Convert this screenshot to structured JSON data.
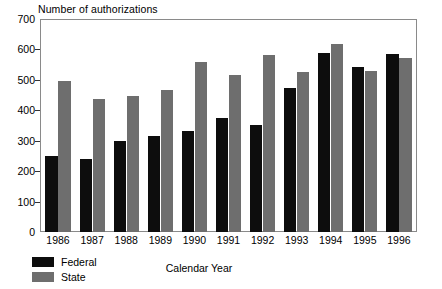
{
  "chart_data": {
    "type": "bar",
    "title": "Number of authorizations",
    "xlabel": "Calendar Year",
    "ylabel": "",
    "categories": [
      "1986",
      "1987",
      "1988",
      "1989",
      "1990",
      "1991",
      "1992",
      "1993",
      "1994",
      "1995",
      "1996"
    ],
    "series": [
      {
        "name": "Federal",
        "color": "#0d0d0d",
        "values": [
          250,
          240,
          300,
          318,
          335,
          378,
          352,
          475,
          590,
          545,
          588
        ]
      },
      {
        "name": "State",
        "color": "#6e6e6e",
        "values": [
          500,
          440,
          450,
          468,
          563,
          520,
          585,
          528,
          620,
          532,
          573
        ]
      }
    ],
    "ylim": [
      0,
      700
    ],
    "yticks": [
      0,
      100,
      200,
      300,
      400,
      500,
      600,
      700
    ],
    "ytick_labels": [
      "0",
      "100",
      "200",
      "300",
      "400",
      "500",
      "600",
      "700"
    ],
    "grid": false,
    "legend_position": "bottom-left"
  },
  "legend": {
    "items": [
      {
        "label": "Federal",
        "color": "#0d0d0d"
      },
      {
        "label": "State",
        "color": "#6e6e6e"
      }
    ]
  }
}
